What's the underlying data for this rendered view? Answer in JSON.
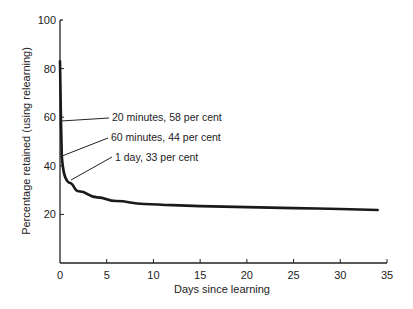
{
  "chart_data": {
    "type": "line",
    "title": "",
    "xlabel": "Days since learning",
    "ylabel": "Percentage retained (using relearning)",
    "xlim": [
      0,
      35
    ],
    "ylim": [
      0,
      100
    ],
    "grid": false,
    "legend": "none",
    "x_ticks": [
      "0",
      "5",
      "10",
      "15",
      "20",
      "25",
      "30",
      "35"
    ],
    "y_ticks": [
      "20",
      "40",
      "60",
      "80",
      "100"
    ],
    "series": [
      {
        "name": "Forgetting curve",
        "x": [
          0,
          0.014,
          0.042,
          1,
          2,
          4,
          6,
          9,
          12,
          15,
          20,
          25,
          30,
          34
        ],
        "y": [
          83,
          58,
          44,
          33,
          29.5,
          27,
          25.5,
          24.3,
          23.8,
          23.4,
          23,
          22.6,
          22.2,
          21.8
        ]
      }
    ],
    "annotations": [
      {
        "text": "20 minutes, 58 per cent",
        "x": 0.014,
        "y": 58
      },
      {
        "text": "60 minutes, 44 per cent",
        "x": 0.042,
        "y": 44
      },
      {
        "text": "1 day, 33 per cent",
        "x": 1,
        "y": 33
      }
    ]
  }
}
